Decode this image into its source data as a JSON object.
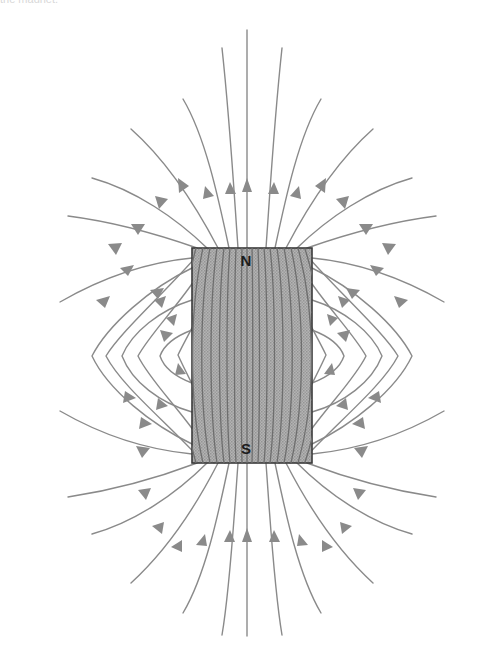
{
  "figure": {
    "name": "bar-magnet-field-lines",
    "background_color": "#ffffff",
    "width": 501,
    "height": 664
  },
  "magnet": {
    "label_north": "N",
    "label_south": "S",
    "fill_color": "#a8a8a8",
    "stroke_color": "#3a3a3a",
    "x": 192,
    "y": 248,
    "width": 120,
    "height": 215
  },
  "field": {
    "line_color": "#8a8a8a",
    "interior_line_color": "#6e6e6e",
    "arrow_color": "#8a8a8a",
    "line_width": 1.4,
    "arrow_count": 46,
    "direction_note": "N to S outside the magnet, S to N inside the magnet"
  },
  "top_crop": {
    "text": "the magnet."
  },
  "chart_data": {
    "type": "diagram",
    "poles": [
      {
        "label": "N",
        "position": "top",
        "x": 246,
        "y": 260
      },
      {
        "label": "S",
        "position": "bottom",
        "x": 246,
        "y": 448
      }
    ],
    "magnet_rect": {
      "x": 192,
      "y": 248,
      "w": 120,
      "h": 215
    },
    "annotations": [],
    "legend": [],
    "grid": false
  }
}
